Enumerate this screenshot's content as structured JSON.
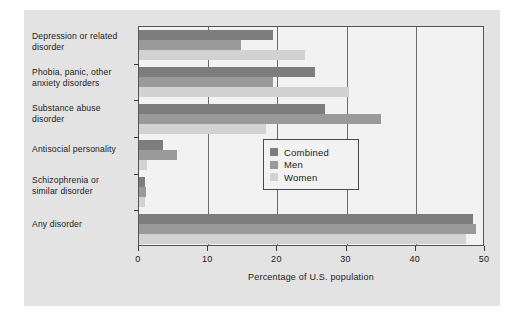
{
  "chart_data": {
    "type": "bar",
    "orientation": "horizontal",
    "title": "",
    "xlabel": "Percentage of U.S. population",
    "ylabel": "",
    "xlim": [
      0,
      50
    ],
    "xticks": [
      0,
      10,
      20,
      30,
      40,
      50
    ],
    "xtick_labels": [
      "0",
      "10",
      "20",
      "30",
      "40",
      "50"
    ],
    "grid": "vertical",
    "legend_position": "right-middle",
    "categories": [
      "Depression or related disorder",
      "Phobia, panic, other anxiety disorders",
      "Substance abuse disorder",
      "Antisocial personality",
      "Schizophrenia or similar disorder",
      "Any disorder"
    ],
    "series": [
      {
        "name": "Combined",
        "color": "#7d7d7d",
        "values": [
          19.3,
          25.4,
          26.9,
          3.5,
          0.9,
          48.2
        ]
      },
      {
        "name": "Men",
        "color": "#9a9a9a",
        "values": [
          14.7,
          19.3,
          35.0,
          5.5,
          1.0,
          48.7
        ]
      },
      {
        "name": "Women",
        "color": "#d2d2d2",
        "values": [
          24.0,
          30.4,
          18.4,
          1.2,
          0.8,
          47.3
        ]
      }
    ]
  },
  "legend": {
    "items": [
      {
        "label": "Combined",
        "color": "#7d7d7d"
      },
      {
        "label": "Men",
        "color": "#9a9a9a"
      },
      {
        "label": "Women",
        "color": "#d2d2d2"
      }
    ]
  },
  "axis": {
    "x_title": "Percentage of U.S. population",
    "ticks": [
      "0",
      "10",
      "20",
      "30",
      "40",
      "50"
    ]
  },
  "category_labels": [
    {
      "line1": "Depression or related",
      "line2": "disorder"
    },
    {
      "line1": "Phobia, panic, other",
      "line2": "anxiety disorders"
    },
    {
      "line1": "Substance abuse",
      "line2": "disorder"
    },
    {
      "line1": "Antisocial personality",
      "line2": ""
    },
    {
      "line1": "Schizophrenia or",
      "line2": "similar disorder"
    },
    {
      "line1": "Any disorder",
      "line2": ""
    }
  ]
}
